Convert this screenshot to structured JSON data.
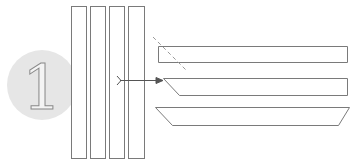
{
  "step": {
    "number": "1",
    "circle_fill": "#e6e6e6",
    "numeral_fill": "#f4f4f4",
    "numeral_stroke": "#8a8a8a"
  },
  "colors": {
    "line": "#7a7a7a",
    "dashed": "#9a9a9a",
    "arrow": "#555555",
    "background": "#ffffff"
  },
  "diagram": {
    "vertical_panels": [
      {
        "x": 71,
        "y": 6,
        "w": 15,
        "h": 152
      },
      {
        "x": 90,
        "y": 6,
        "w": 15,
        "h": 152
      },
      {
        "x": 109,
        "y": 6,
        "w": 15,
        "h": 152
      },
      {
        "x": 128,
        "y": 6,
        "w": 16,
        "h": 152
      }
    ],
    "bars": [
      {
        "name": "straight-bar",
        "points": "158,46 347,46 347,62 158,62"
      },
      {
        "name": "one-end-mitred-bar",
        "points": "163,78 347,78 347,95 179,95"
      },
      {
        "name": "trapezoid-bar",
        "points": "155,107 349,107 338,125 172,125"
      }
    ],
    "cut_line": {
      "x1": 153,
      "y1": 37,
      "x2": 187,
      "y2": 71
    },
    "arrow": {
      "x1": 120,
      "y1": 80,
      "x2": 163,
      "y2": 80
    }
  }
}
